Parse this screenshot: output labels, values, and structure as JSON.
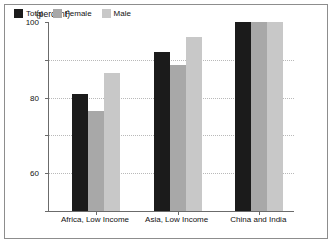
{
  "chart_data": {
    "type": "bar",
    "title": "",
    "subtitle": "",
    "xlabel": "",
    "ylabel": "(percent)",
    "unit_label": "(percent)",
    "ylim": [
      0,
      100
    ],
    "yticks": [
      0,
      20,
      40,
      60,
      80,
      100
    ],
    "ytick_labels": [
      "0",
      "20",
      "40",
      "60",
      "80",
      "100"
    ],
    "grid": true,
    "legend_position": "top-left-inside",
    "categories": [
      "Africa, Low Income",
      "Asia, Low Income",
      "China and India"
    ],
    "series": [
      {
        "name": "Total",
        "color": "#1b1b1b",
        "values": [
          62,
          84,
          100
        ]
      },
      {
        "name": "Female",
        "color": "#a8a8a8",
        "values": [
          53,
          77,
          100
        ]
      },
      {
        "name": "Male",
        "color": "#c8c8c8",
        "values": [
          73,
          92,
          100
        ]
      }
    ]
  },
  "legend": {
    "items": [
      {
        "label": "Total",
        "color": "#1b1b1b"
      },
      {
        "label": "Female",
        "color": "#a8a8a8"
      },
      {
        "label": "Male",
        "color": "#c8c8c8"
      }
    ]
  },
  "axis": {
    "unit_label": "(percent)",
    "y_tick_labels": [
      "100",
      "80",
      "60",
      "40",
      "20",
      "0"
    ],
    "x_category_labels": [
      "Africa, Low Income",
      "Asia, Low Income",
      "China and India"
    ]
  }
}
